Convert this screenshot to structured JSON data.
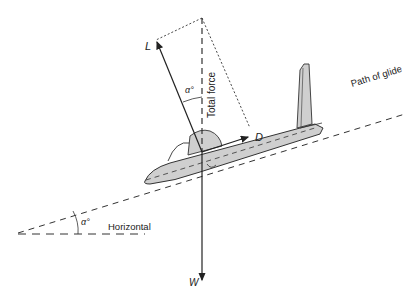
{
  "diagram": {
    "labels": {
      "lift": "L",
      "drag": "D",
      "weight": "W",
      "total_force": "Total force",
      "path": "Path of glide",
      "horizontal": "Horizontal",
      "angle_top": "α°",
      "angle_bottom": "α°"
    },
    "colors": {
      "line": "#222222",
      "fuselage": "#cfcfcf"
    }
  }
}
